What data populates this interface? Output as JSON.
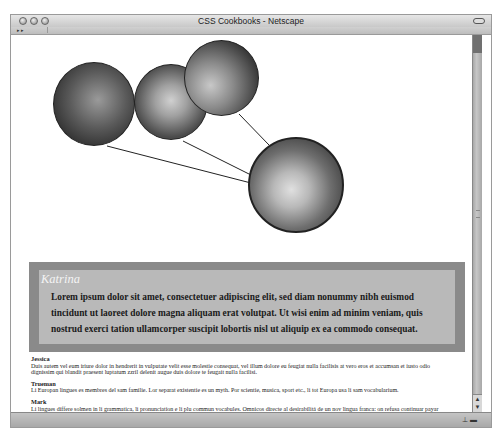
{
  "window": {
    "title": "CSS Cookbooks - Netscape",
    "nav_buttons": "▸ ▸"
  },
  "photos": [
    {
      "name": "photo-man-glasses",
      "desc": "man with glasses"
    },
    {
      "name": "photo-woman",
      "desc": "smiling woman"
    },
    {
      "name": "photo-couple",
      "desc": "couple"
    },
    {
      "name": "photo-katrina",
      "desc": "Katrina"
    }
  ],
  "featured": {
    "name": "Katrina",
    "text": "Lorem ipsum dolor sit amet, consectetuer adipiscing elit, sed diam nonummy nibh euismod tincidunt ut laoreet dolore magna aliquam erat volutpat. Ut wisi enim ad minim veniam, quis nostrud exerci tation ullamcorper suscipit lobortis nisl ut aliquip ex ea commodo consequat."
  },
  "people": [
    {
      "name": "Jessica",
      "text": "Duis autem vel eum iriure dolor in hendrerit in vulputate velit esse molestie consequat, vel illum dolore eu feugiat nulla facilisis at vero eros et accumsan et iusto odio dignissim qui blandit praesent luptatum zzril delenit augue duis dolore te feugait nulla facilisi."
    },
    {
      "name": "Trueman",
      "text": "Li Europan lingues es membres del sam familie. Lor separat existentie es un myth. Por scientie, musica, sport etc., li tot Europa usa li sam vocabularium."
    },
    {
      "name": "Mark",
      "text": "Li lingues differe solmen in li grammatica, li pronunciation e li plu commun vocabules. Omnicos directe al desirabilitá de un nov lingua franca: on refusa continuar payar custosi traductores. It solmen va esser necessi far uniform grammatica, pronunciation e plu sommun paroles."
    }
  ],
  "scrollbar": {
    "up_arrow": "▲",
    "down_arrow": "▼"
  },
  "status": {
    "icons": "⊥ ▬"
  },
  "colors": {
    "featured_outer": "#8a8a8a",
    "featured_inner": "#b9b9b9"
  }
}
